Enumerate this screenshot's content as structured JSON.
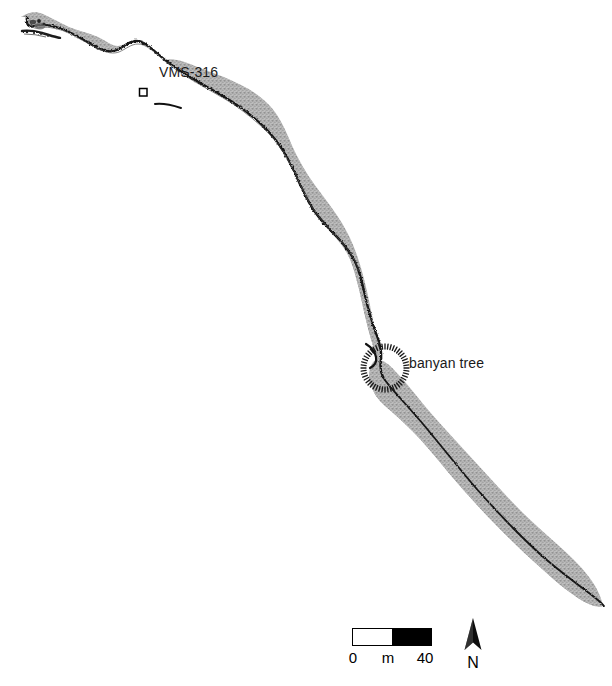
{
  "figure": {
    "kind": "archaeological-site-map",
    "width": 612,
    "height": 686,
    "background_color": "#ffffff"
  },
  "landform": {
    "name": "coastal-sand-terrace",
    "fill_color": "#b3b3b3",
    "stipple_color": "#8f8f8f",
    "seaward_edge_color": "#1a1a1a",
    "orientation": "northwest-to-southeast"
  },
  "labels": {
    "site": "VMS-316",
    "banyan": "banyan tree"
  },
  "site_marker": {
    "symbol_name": "open-square-marker",
    "outline_color": "#000000"
  },
  "banyan_marker": {
    "symbol_name": "dotted-circle-canopy",
    "stroke_color": "#1a1a1a",
    "radius": 24
  },
  "scale": {
    "start_label": "0",
    "unit_label": "m",
    "end_label": "40",
    "segments": [
      "#ffffff",
      "#000000"
    ],
    "border_color": "#000000",
    "length_px": 80
  },
  "north": {
    "letter": "N",
    "arrow_name": "north-arrow-icon",
    "color": "#000000"
  }
}
